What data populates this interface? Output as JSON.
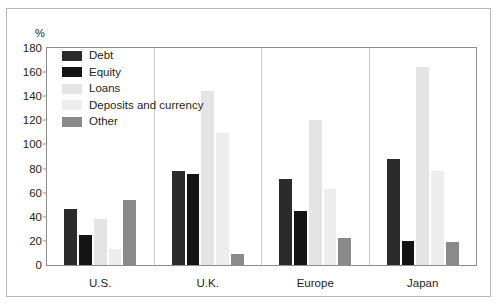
{
  "figure": {
    "unit_label": "%",
    "frame_color": "#8c8c8c"
  },
  "chart_data": {
    "type": "bar",
    "title": "",
    "subtitle": "",
    "xlabel": "",
    "ylabel": "%",
    "ylim": [
      0,
      180
    ],
    "yticks": [
      0,
      20,
      40,
      60,
      80,
      100,
      120,
      140,
      160,
      180
    ],
    "ytick_labels": [
      "0",
      "20",
      "40",
      "60",
      "80",
      "100",
      "120",
      "140",
      "160",
      "180"
    ],
    "grid": false,
    "legend_position": "upper-left-inside",
    "categories": [
      "U.S.",
      "U.K.",
      "Europe",
      "Japan"
    ],
    "series": [
      {
        "name": "Debt",
        "color": "#2b2b2b",
        "values": [
          47,
          79,
          72,
          89
        ]
      },
      {
        "name": "Equity",
        "color": "#141414",
        "values": [
          26,
          76,
          46,
          21
        ]
      },
      {
        "name": "Loans",
        "color": "#e4e4e4",
        "values": [
          39,
          145,
          121,
          165
        ]
      },
      {
        "name": "Deposits and currency",
        "color": "#ededed",
        "values": [
          14,
          110,
          64,
          79
        ]
      },
      {
        "name": "Other",
        "color": "#8a8a8a",
        "values": [
          55,
          10,
          23,
          20
        ]
      }
    ]
  }
}
